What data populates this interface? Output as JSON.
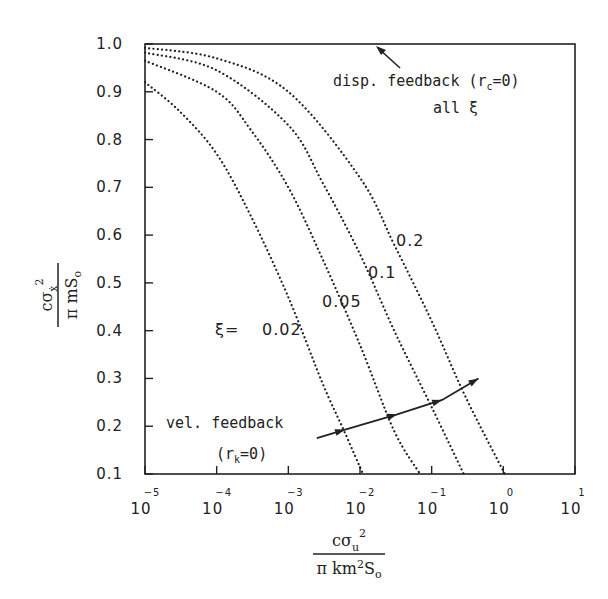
{
  "chart_data": {
    "type": "line",
    "title": "",
    "xscale": "log",
    "xlim": [
      1e-05,
      10
    ],
    "ylim": [
      0.1,
      1.0
    ],
    "grid": false,
    "legend": "none (inline curve labels)",
    "xlabel": {
      "numerator": "cσ_u²",
      "denominator": "π k m² S₀",
      "text": "c σ_u² / (π k m² S_o)"
    },
    "ylabel": {
      "numerator": "cσ_ẋ²",
      "denominator": "π m S₀",
      "text": "c σ_ẋ² / (π m S_o)"
    },
    "x_ticks": [
      {
        "base": "10",
        "exp": "-5"
      },
      {
        "base": "10",
        "exp": "-4"
      },
      {
        "base": "10",
        "exp": "-3"
      },
      {
        "base": "10",
        "exp": "-2"
      },
      {
        "base": "10",
        "exp": "-1"
      },
      {
        "base": "10",
        "exp": "0"
      },
      {
        "base": "10",
        "exp": "1"
      }
    ],
    "y_ticks": [
      "1.0",
      "0.9",
      "0.8",
      "0.7",
      "0.6",
      "0.5",
      "0.4",
      "0.3",
      "0.2",
      "0.1"
    ],
    "series": [
      {
        "name": "ξ = 0.02",
        "label": "0.02",
        "style": "dotted",
        "points": [
          [
            1e-05,
            0.92
          ],
          [
            3e-05,
            0.86
          ],
          [
            0.0001,
            0.77
          ],
          [
            0.0003,
            0.64
          ],
          [
            0.001,
            0.47
          ],
          [
            0.003,
            0.29
          ],
          [
            0.006,
            0.19
          ],
          [
            0.011,
            0.1
          ]
        ]
      },
      {
        "name": "ξ = 0.05",
        "label": "0.05",
        "style": "dotted",
        "points": [
          [
            1e-05,
            0.965
          ],
          [
            0.0001,
            0.9
          ],
          [
            0.0003,
            0.82
          ],
          [
            0.001,
            0.7
          ],
          [
            0.003,
            0.55
          ],
          [
            0.01,
            0.37
          ],
          [
            0.03,
            0.19
          ],
          [
            0.069,
            0.1
          ]
        ]
      },
      {
        "name": "ξ = 0.1",
        "label": "0.1",
        "style": "dotted",
        "points": [
          [
            1e-05,
            0.982
          ],
          [
            0.0001,
            0.945
          ],
          [
            0.001,
            0.83
          ],
          [
            0.003,
            0.71
          ],
          [
            0.01,
            0.56
          ],
          [
            0.03,
            0.4
          ],
          [
            0.1,
            0.24
          ],
          [
            0.28,
            0.1
          ]
        ]
      },
      {
        "name": "ξ = 0.2",
        "label": "0.2",
        "style": "dotted",
        "points": [
          [
            1e-05,
            0.992
          ],
          [
            0.0001,
            0.97
          ],
          [
            0.001,
            0.9
          ],
          [
            0.01,
            0.72
          ],
          [
            0.03,
            0.58
          ],
          [
            0.1,
            0.42
          ],
          [
            0.3,
            0.26
          ],
          [
            1.05,
            0.1
          ]
        ]
      },
      {
        "name": "disp. feedback (r_c=0), all ξ",
        "style": "solid",
        "points": [
          [
            1e-05,
            1.0
          ],
          [
            10,
            1.0
          ]
        ]
      },
      {
        "name": "vel. feedback (r_k=0)",
        "style": "solid-arrowed",
        "points": [
          [
            0.0025,
            0.175
          ],
          [
            0.0062,
            0.193
          ],
          [
            0.033,
            0.225
          ],
          [
            0.14,
            0.255
          ],
          [
            0.45,
            0.3
          ]
        ]
      }
    ],
    "annotations": {
      "xi_prefix": "ξ=",
      "disp_line1_a": "disp. feedback (r",
      "disp_sub": "c",
      "disp_line1_b": "=0)",
      "disp_line2": "all ξ",
      "vel_line1": "vel. feedback",
      "vel_line2_a": "(r",
      "vel_sub": "k",
      "vel_line2_b": "=0)"
    },
    "colors": {
      "ink": "#222222",
      "background": "#ffffff"
    }
  }
}
